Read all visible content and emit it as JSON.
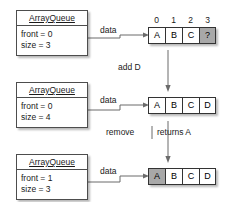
{
  "diagram": {
    "title_text": "ArrayQueue enqueue and dequeue state transitions",
    "states": [
      {
        "id": "state-initial",
        "object": {
          "class_name": "ArrayQueue",
          "fields": [
            {
              "label": "front = 0"
            },
            {
              "label": "size = 3"
            }
          ]
        },
        "link_label": "data",
        "show_indices": true,
        "indices": [
          "0",
          "1",
          "2",
          "3"
        ],
        "array": [
          {
            "value": "A",
            "shaded": false
          },
          {
            "value": "B",
            "shaded": false
          },
          {
            "value": "C",
            "shaded": false
          },
          {
            "value": "?",
            "shaded": true
          }
        ]
      },
      {
        "id": "state-after-add",
        "object": {
          "class_name": "ArrayQueue",
          "fields": [
            {
              "label": "front = 0"
            },
            {
              "label": "size = 4"
            }
          ]
        },
        "link_label": "data",
        "show_indices": false,
        "indices": [],
        "array": [
          {
            "value": "A",
            "shaded": false
          },
          {
            "value": "B",
            "shaded": false
          },
          {
            "value": "C",
            "shaded": false
          },
          {
            "value": "D",
            "shaded": false
          }
        ]
      },
      {
        "id": "state-after-remove",
        "object": {
          "class_name": "ArrayQueue",
          "fields": [
            {
              "label": "front = 1"
            },
            {
              "label": "size = 3"
            }
          ]
        },
        "link_label": "data",
        "show_indices": false,
        "indices": [],
        "array": [
          {
            "value": "A",
            "shaded": true
          },
          {
            "value": "B",
            "shaded": false
          },
          {
            "value": "C",
            "shaded": false
          },
          {
            "value": "D",
            "shaded": false
          }
        ]
      }
    ],
    "transitions": [
      {
        "id": "transition-add",
        "label": "add D",
        "return_label": ""
      },
      {
        "id": "transition-remove",
        "label": "remove",
        "return_label": "returns A"
      }
    ],
    "colors": {
      "box_border": "#4d4d4d",
      "cell_border": "#333333",
      "shaded_cell": "#a8a8a8",
      "connector": "#6b6b6b",
      "text": "#1a1a1a",
      "background": "#ffffff"
    }
  }
}
